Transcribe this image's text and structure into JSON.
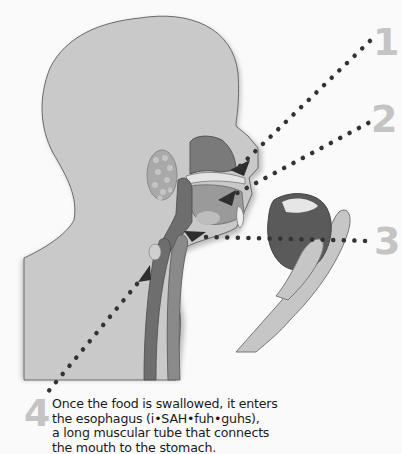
{
  "figure": {
    "labels": [
      {
        "number": "1",
        "target": "nasal cavity / upper palate"
      },
      {
        "number": "2",
        "target": "mouth / tongue"
      },
      {
        "number": "3",
        "target": "throat / pharynx"
      },
      {
        "number": "4",
        "target": "esophagus"
      }
    ],
    "caption_lines": [
      "Once the food is swallowed, it enters",
      "the esophagus (i•SAH•fuh•guhs),",
      "a long muscular tube that connects",
      "the mouth to the stomach."
    ],
    "colors": {
      "background": "#fafafa",
      "skin": "#c9c9c9",
      "outline": "#6a6a6a",
      "dark_tissue": "#6e6e6e",
      "dots": "#333333",
      "numbers": "#c4c4c4"
    }
  }
}
